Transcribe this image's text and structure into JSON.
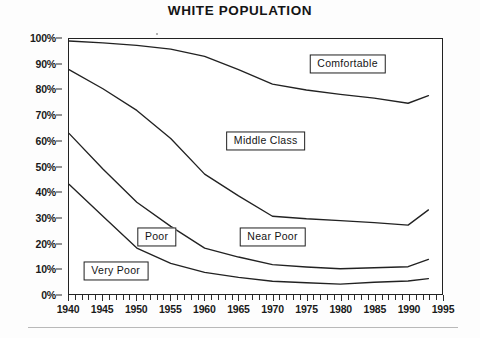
{
  "chart_data": {
    "type": "line",
    "title": "WHITE POPULATION",
    "xlabel": "",
    "ylabel": "",
    "xlim": [
      1940,
      1995
    ],
    "ylim": [
      0,
      100
    ],
    "grid": false,
    "legend_position": "inline-boxed-labels",
    "x_tick_labels": [
      "1940",
      "1945",
      "1950",
      "1955",
      "1960",
      "1965",
      "1970",
      "1975",
      "1980",
      "1985",
      "1990",
      "1995"
    ],
    "x_tick_values": [
      1940,
      1945,
      1950,
      1955,
      1960,
      1965,
      1970,
      1975,
      1980,
      1985,
      1990,
      1995
    ],
    "x_minor_tick_interval": 1,
    "y_tick_labels": [
      "0%",
      "10%",
      "20%",
      "30%",
      "40%",
      "50%",
      "60%",
      "70%",
      "80%",
      "90%",
      "100%"
    ],
    "y_tick_values": [
      0,
      10,
      20,
      30,
      40,
      50,
      60,
      70,
      80,
      90,
      100
    ],
    "band_labels": [
      "Comfortable",
      "Middle Class",
      "Near Poor",
      "Poor",
      "Very Poor"
    ],
    "x": [
      1940,
      1945,
      1950,
      1955,
      1960,
      1965,
      1970,
      1975,
      1980,
      1985,
      1990,
      1993
    ],
    "series": [
      {
        "name": "Comfortable lower boundary",
        "band_above": "Comfortable",
        "values": [
          99.2,
          98.5,
          97.5,
          96.0,
          93.2,
          88.0,
          82.3,
          80.0,
          78.3,
          76.8,
          74.8,
          77.8
        ]
      },
      {
        "name": "Middle Class lower boundary",
        "band_above": "Middle Class",
        "values": [
          88.0,
          80.5,
          72.0,
          61.0,
          47.0,
          38.5,
          30.5,
          29.5,
          28.8,
          28.0,
          27.0,
          33.0
        ]
      },
      {
        "name": "Near Poor lower boundary",
        "band_above": "Near Poor",
        "values": [
          63.0,
          49.0,
          36.0,
          26.5,
          18.0,
          14.5,
          11.5,
          10.6,
          9.9,
          10.3,
          10.7,
          13.6
        ]
      },
      {
        "name": "Very Poor upper boundary",
        "band_above": "Poor",
        "band_below": "Very Poor",
        "values": [
          43.0,
          30.5,
          18.0,
          12.0,
          8.5,
          6.5,
          5.0,
          4.4,
          3.9,
          4.6,
          5.1,
          6.0
        ]
      }
    ],
    "annotations": [
      {
        "text": "Comfortable",
        "x": 1981,
        "y": 90
      },
      {
        "text": "Middle Class",
        "x": 1969,
        "y": 60
      },
      {
        "text": "Near Poor",
        "x": 1970,
        "y": 22.5
      },
      {
        "text": "Poor",
        "x": 1953,
        "y": 22.5
      },
      {
        "text": "Very Poor",
        "x": 1947,
        "y": 9.5
      }
    ]
  },
  "chart": {
    "title": "WHITE POPULATION",
    "axis": {
      "y_ticks": [
        {
          "label": "100%",
          "value": 100
        },
        {
          "label": "90%",
          "value": 90
        },
        {
          "label": "80%",
          "value": 80
        },
        {
          "label": "70%",
          "value": 70
        },
        {
          "label": "60%",
          "value": 60
        },
        {
          "label": "50%",
          "value": 50
        },
        {
          "label": "40%",
          "value": 40
        },
        {
          "label": "30%",
          "value": 30
        },
        {
          "label": "20%",
          "value": 20
        },
        {
          "label": "10%",
          "value": 10
        },
        {
          "label": "0%",
          "value": 0
        }
      ],
      "x_ticks": [
        {
          "label": "1940",
          "value": 1940
        },
        {
          "label": "1945",
          "value": 1945
        },
        {
          "label": "1950",
          "value": 1950
        },
        {
          "label": "1955",
          "value": 1955
        },
        {
          "label": "1960",
          "value": 1960
        },
        {
          "label": "1965",
          "value": 1965
        },
        {
          "label": "1970",
          "value": 1970
        },
        {
          "label": "1975",
          "value": 1975
        },
        {
          "label": "1980",
          "value": 1980
        },
        {
          "label": "1985",
          "value": 1985
        },
        {
          "label": "1990",
          "value": 1990
        },
        {
          "label": "1995",
          "value": 1995
        }
      ]
    },
    "labels": {
      "comfortable": "Comfortable",
      "middle_class": "Middle Class",
      "near_poor": "Near Poor",
      "poor": "Poor",
      "very_poor": "Very Poor"
    },
    "colors": {
      "line": "#222222",
      "text": "#141414",
      "background": "#ffffff"
    }
  }
}
